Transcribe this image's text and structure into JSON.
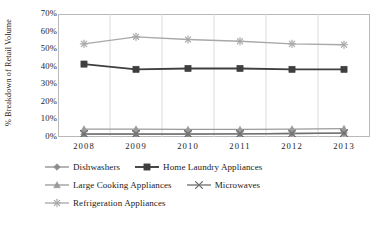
{
  "chart_data": {
    "type": "line",
    "title": "",
    "xlabel": "",
    "ylabel": "% Breakdown of Retail Volume",
    "categories": [
      "2008",
      "2009",
      "2010",
      "2011",
      "2012",
      "2013"
    ],
    "ylim": [
      0,
      70
    ],
    "ytick_labels": [
      "70%",
      "60%",
      "50%",
      "40%",
      "30%",
      "20%",
      "10%",
      "0%"
    ],
    "ytick_values": [
      70,
      60,
      50,
      40,
      30,
      20,
      10,
      0
    ],
    "grid": "vertical",
    "legend_position": "bottom",
    "series": [
      {
        "name": "Dishwashers",
        "marker": "diamond",
        "color": "#8c8c8c",
        "values": [
          1.5,
          1.5,
          1.5,
          1.8,
          2.0,
          2.2
        ]
      },
      {
        "name": "Home Laundry Appliances",
        "marker": "square",
        "color": "#3f3f3f",
        "values": [
          41.5,
          38.5,
          39.0,
          39.0,
          38.5,
          38.5
        ]
      },
      {
        "name": "Large Cooking Appliances",
        "marker": "triangle",
        "color": "#9a9a9a",
        "values": [
          4.5,
          4.5,
          4.3,
          4.3,
          4.5,
          4.8
        ]
      },
      {
        "name": "Microwaves",
        "marker": "x",
        "color": "#6e6e6e",
        "values": [
          1.8,
          1.8,
          1.8,
          1.8,
          2.0,
          2.2
        ]
      },
      {
        "name": "Refrigeration Appliances",
        "marker": "asterisk",
        "color": "#a8a8a8",
        "values": [
          53.0,
          57.0,
          55.5,
          54.5,
          53.0,
          52.5
        ]
      }
    ]
  },
  "legend": {
    "rows": [
      [
        "Dishwashers",
        "Home Laundry Appliances"
      ],
      [
        "Large Cooking Appliances",
        "Microwaves"
      ],
      [
        "Refrigeration Appliances"
      ]
    ]
  },
  "colors": {
    "axis": "#b9b9b9",
    "grid": "#dcdcdc",
    "text": "#1a1a1a"
  }
}
